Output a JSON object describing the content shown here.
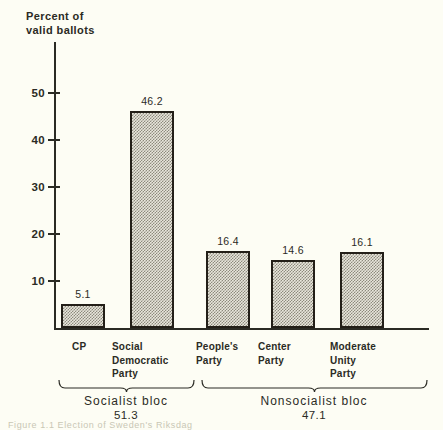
{
  "chart_data": {
    "type": "bar",
    "title": "",
    "ylabel": "Percent of\nvalid ballots",
    "xlabel": "",
    "ylim": [
      0,
      55
    ],
    "yticks": [
      10,
      20,
      30,
      40,
      50
    ],
    "ytick_labels": [
      "10",
      "20",
      "30",
      "40",
      "50"
    ],
    "grid": false,
    "legend": "none",
    "categories": [
      "CP",
      "Social\nDemocratic\nParty",
      "People's\nParty",
      "Center\nParty",
      "Moderate\nUnity\nParty"
    ],
    "values": [
      5.1,
      46.2,
      16.4,
      14.6,
      16.1
    ],
    "value_labels": [
      "5.1",
      "46.2",
      "16.4",
      "14.6",
      "16.1"
    ],
    "groups": [
      {
        "name": "Socialist bloc",
        "value": "51.3",
        "members": [
          "CP",
          "Social Democratic Party"
        ]
      },
      {
        "name": "Nonsocialist bloc",
        "value": "47.1",
        "members": [
          "People's Party",
          "Center Party",
          "Moderate Unity Party"
        ]
      }
    ],
    "colors": {
      "background": "#fdfdf4",
      "ink": "#2b2b24",
      "bar_fill": "#e8e6dc",
      "bar_pattern": "#8d8a7d",
      "bar_border": "#231f18"
    }
  },
  "caption": "Figure 1.1  Election of Sweden's Riksdag"
}
